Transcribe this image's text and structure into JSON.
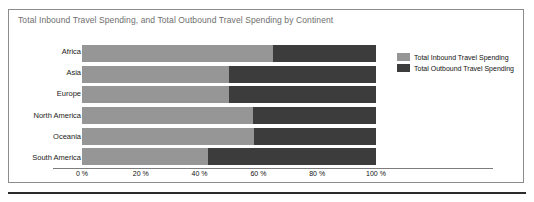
{
  "chart_data": {
    "type": "bar",
    "orientation": "horizontal",
    "stacked": true,
    "normalized": true,
    "title": "Total Inbound Travel Spending, and Total Outbound Travel Spending by Continent",
    "xlabel": "",
    "ylabel": "",
    "xlim": [
      0,
      100
    ],
    "grid": false,
    "legend_position": "right",
    "categories": [
      "Africa",
      "Asia",
      "Europe",
      "North America",
      "Oceania",
      "South America"
    ],
    "xticks": [
      0,
      20,
      40,
      60,
      80,
      100
    ],
    "xticklabels": [
      "0 %",
      "20 %",
      "40 %",
      "60 %",
      "80 %",
      "100 %"
    ],
    "series": [
      {
        "name": "Total Inbound Travel Spending",
        "color": "#969696",
        "values": [
          65,
          50,
          50,
          58,
          58.5,
          43
        ]
      },
      {
        "name": "Total Outbound Travel Spending",
        "color": "#3c3c3c",
        "values": [
          35,
          50,
          50,
          42,
          41.5,
          57
        ]
      }
    ]
  },
  "legend": {
    "items": [
      {
        "label": "Total Inbound Travel Spending",
        "color": "#969696"
      },
      {
        "label": "Total Outbound Travel Spending",
        "color": "#3c3c3c"
      }
    ]
  }
}
